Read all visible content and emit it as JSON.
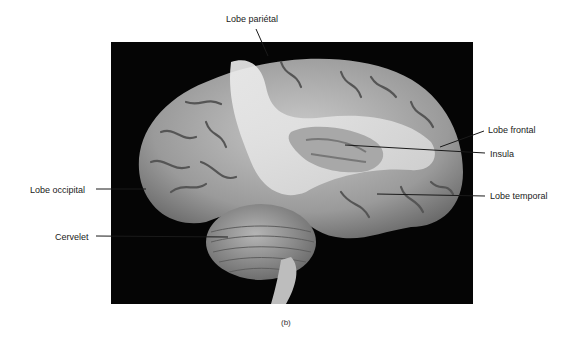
{
  "figure": {
    "caption": "(b)",
    "background_color": "#050505",
    "labels": {
      "parietal": "Lobe pariétal",
      "frontal": "Lobe frontal",
      "insula": "Insula",
      "occipital": "Lobe occipital",
      "temporal": "Lobe temporal",
      "cerebellum": "Cervelet"
    }
  }
}
